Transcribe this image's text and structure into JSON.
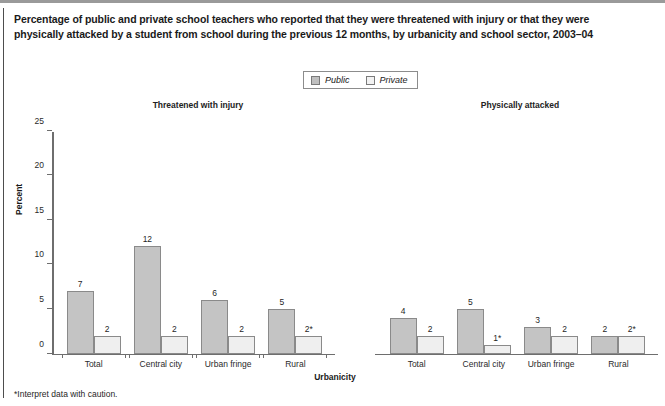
{
  "chart_data": {
    "type": "bar",
    "title": "Percentage of public and private school teachers who reported that they were threatened with injury or that they were physically attacked by a student from school during the previous 12 months, by urbanicity and school sector, 2003–04",
    "xlabel": "Urbanicity",
    "ylabel": "Percent",
    "ylim": [
      0,
      25
    ],
    "yticks": [
      0,
      5,
      10,
      15,
      20,
      25
    ],
    "ytick_labels": [
      "0",
      "5",
      "10",
      "15",
      "20",
      "25"
    ],
    "grid": false,
    "legend": {
      "position": "top-center",
      "entries": [
        {
          "name": "Public",
          "color": "#c4c4c4"
        },
        {
          "name": "Private",
          "color": "#efefef"
        }
      ]
    },
    "categories": [
      "Total",
      "Central city",
      "Urban fringe",
      "Rural"
    ],
    "panels": [
      {
        "caption": "Threatened with injury",
        "series": [
          {
            "name": "Public",
            "values": [
              7,
              12,
              6,
              5
            ],
            "labels": [
              "7",
              "12",
              "6",
              "5"
            ]
          },
          {
            "name": "Private",
            "values": [
              2,
              2,
              2,
              2
            ],
            "labels": [
              "2",
              "2",
              "2",
              "2*"
            ]
          }
        ]
      },
      {
        "caption": "Physically attacked",
        "series": [
          {
            "name": "Public",
            "values": [
              4,
              5,
              3,
              2
            ],
            "labels": [
              "4",
              "5",
              "3",
              "2"
            ]
          },
          {
            "name": "Private",
            "values": [
              2,
              1,
              2,
              2
            ],
            "labels": [
              "2",
              "1*",
              "2",
              "2*"
            ]
          }
        ]
      }
    ],
    "footnote": "*Interpret data with caution.",
    "annotations": [
      "* denotes: Interpret data with caution."
    ]
  }
}
